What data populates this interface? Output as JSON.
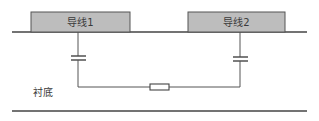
{
  "diagram": {
    "title": "",
    "conductors": [
      {
        "id": "wire1",
        "label": "导线1"
      },
      {
        "id": "wire2",
        "label": "导线2"
      }
    ],
    "substrate": {
      "label": "衬底"
    },
    "components": [
      {
        "type": "capacitor",
        "between": [
          "wire1",
          "substrate"
        ]
      },
      {
        "type": "capacitor",
        "between": [
          "wire2",
          "substrate"
        ]
      },
      {
        "type": "resistor",
        "between": [
          "capacitor-1",
          "capacitor-2"
        ]
      }
    ],
    "colors": {
      "conductor_fill": "#bdbdbd",
      "conductor_stroke": "#555555",
      "line": "#444444",
      "background": "#ffffff"
    }
  }
}
